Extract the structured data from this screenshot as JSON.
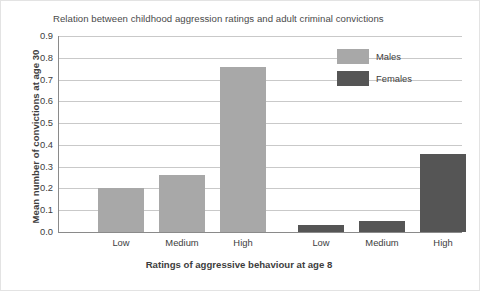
{
  "chart_data": {
    "type": "bar",
    "title": "Relation between childhood aggression ratings and adult criminal convictions",
    "xlabel": "Ratings of aggressive behaviour at age 8",
    "ylabel": "Mean number of convictions at age 30",
    "categories": [
      "Low",
      "Medium",
      "High"
    ],
    "series": [
      {
        "name": "Males",
        "values": [
          0.2,
          0.26,
          0.76
        ],
        "color": "#a8a8a8"
      },
      {
        "name": "Females",
        "values": [
          0.03,
          0.05,
          0.36
        ],
        "color": "#555555"
      }
    ],
    "ylim": [
      0.0,
      0.9
    ],
    "ytick_labels": [
      "0.9",
      "0.8",
      "0.7",
      "0.6",
      "0.5",
      "0.4",
      "0.3",
      "0.2",
      "0.1",
      "0.0"
    ],
    "ytick_values": [
      0.9,
      0.8,
      0.7,
      0.6,
      0.5,
      0.4,
      0.3,
      0.2,
      0.1,
      0.0
    ],
    "grid": true,
    "legend_position": "upper right",
    "x_tick_labels": [
      "Low",
      "Medium",
      "High",
      "Low",
      "Medium",
      "High"
    ],
    "bar_order": [
      {
        "group": "Males",
        "category": "Low",
        "value": 0.2
      },
      {
        "group": "Males",
        "category": "Medium",
        "value": 0.26
      },
      {
        "group": "Males",
        "category": "High",
        "value": 0.76
      },
      {
        "group": "Females",
        "category": "Low",
        "value": 0.03
      },
      {
        "group": "Females",
        "category": "Medium",
        "value": 0.05
      },
      {
        "group": "Females",
        "category": "High",
        "value": 0.36
      }
    ]
  },
  "legend": {
    "items": [
      {
        "label": "Males",
        "color": "#a8a8a8"
      },
      {
        "label": "Females",
        "color": "#555555"
      }
    ]
  },
  "colors": {
    "males": "#a8a8a8",
    "females": "#555555",
    "grid": "#c9c9c9",
    "axis": "#8a8a8a",
    "text": "#3d3d3d",
    "title_text": "#4a4a4a",
    "background": "#ffffff",
    "frame": "#e3e3e3"
  }
}
